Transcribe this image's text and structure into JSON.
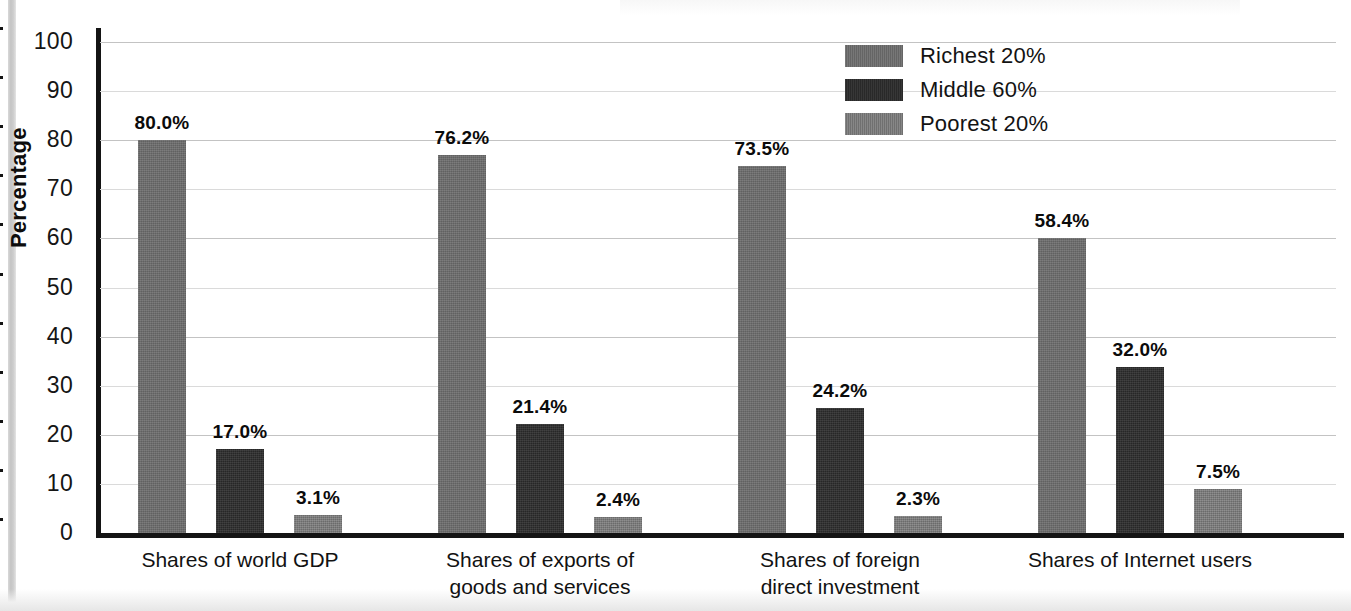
{
  "chart_data": {
    "type": "bar",
    "title": "",
    "xlabel": "",
    "ylabel": "Percentage",
    "ylim": [
      0,
      100
    ],
    "ytick_step": 10,
    "yticks": [
      0,
      10,
      20,
      30,
      40,
      50,
      60,
      70,
      80,
      90,
      100
    ],
    "grid": true,
    "grid_axis": "y",
    "legend_position": "top-right",
    "value_label_suffix": "%",
    "categories": [
      "Shares of world GDP",
      "Shares of exports of\ngoods and services",
      "Shares of foreign\ndirect investment",
      "Shares of Internet users"
    ],
    "series": [
      {
        "name": "Richest 20%",
        "color": "#6a6a6a",
        "values": [
          80.0,
          76.2,
          73.5,
          58.4
        ],
        "labels": [
          "80.0%",
          "76.2%",
          "73.5%",
          "58.4%"
        ],
        "drawn_heights": [
          80.0,
          77.0,
          74.8,
          60.0
        ]
      },
      {
        "name": "Middle 60%",
        "color": "#2b2b2b",
        "values": [
          17.0,
          21.4,
          24.2,
          32.0
        ],
        "labels": [
          "17.0%",
          "21.4%",
          "24.2%",
          "32.0%"
        ],
        "drawn_heights": [
          17.2,
          22.3,
          25.4,
          33.8
        ]
      },
      {
        "name": "Poorest 20%",
        "color": "#767676",
        "values": [
          3.1,
          2.4,
          2.3,
          7.5
        ],
        "labels": [
          "3.1%",
          "2.4%",
          "2.3%",
          "7.5%"
        ],
        "drawn_heights": [
          3.6,
          3.2,
          3.5,
          9.0
        ]
      }
    ]
  },
  "axis": {
    "y_title": "Percentage",
    "tick_labels": [
      "0",
      "10",
      "20",
      "30",
      "40",
      "50",
      "60",
      "70",
      "80",
      "90",
      "100"
    ]
  },
  "legend": {
    "items": [
      {
        "label": "Richest 20%",
        "swatch": "legend-swatch-richest"
      },
      {
        "label": "Middle 60%",
        "swatch": "legend-swatch-middle"
      },
      {
        "label": "Poorest 20%",
        "swatch": "legend-swatch-poorest"
      }
    ]
  }
}
